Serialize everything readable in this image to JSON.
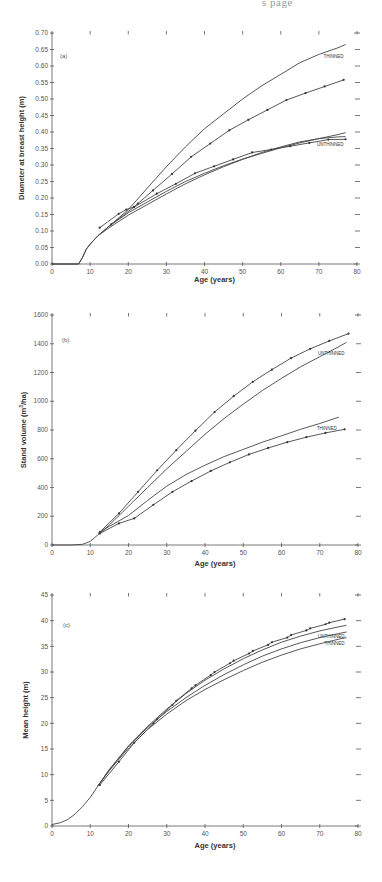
{
  "page_header": "s page",
  "chart_data": [
    {
      "type": "line",
      "panel": "(a)",
      "title": "",
      "xlabel": "Age (years)",
      "ylabel": "Diameter at breast height (m)",
      "xlim": [
        0,
        80
      ],
      "ylim": [
        0,
        0.7
      ],
      "xticks": [
        0,
        10,
        20,
        30,
        40,
        50,
        60,
        70,
        80
      ],
      "yticks": [
        0.0,
        0.05,
        0.1,
        0.15,
        0.2,
        0.25,
        0.3,
        0.35,
        0.4,
        0.45,
        0.5,
        0.55,
        0.6,
        0.65,
        0.7
      ],
      "ytick_labels": [
        "0.00",
        "0.05",
        "0.10",
        "0.15",
        "0.20",
        "0.25",
        "0.30",
        "0.35",
        "0.40",
        "0.45",
        "0.50",
        "0.55",
        "0.60",
        "0.65",
        "0.70"
      ],
      "grid": false,
      "series": [
        {
          "name": "THINNED (model)",
          "label": "THINNED",
          "markers": false,
          "x": [
            0,
            7,
            8,
            9,
            10,
            12,
            15,
            20,
            25,
            30,
            35,
            40,
            45,
            50,
            55,
            60,
            65,
            70,
            75,
            77
          ],
          "y": [
            0,
            0,
            0.02,
            0.045,
            0.06,
            0.085,
            0.115,
            0.165,
            0.23,
            0.295,
            0.355,
            0.41,
            0.455,
            0.5,
            0.54,
            0.575,
            0.61,
            0.635,
            0.655,
            0.665
          ]
        },
        {
          "name": "THINNED (observed)",
          "label": "",
          "markers": true,
          "x": [
            12.5,
            17.5,
            19.5,
            21.5,
            22.5,
            26.5,
            31.5,
            36.5,
            41.5,
            46.5,
            51.5,
            56.5,
            61.5,
            66.5,
            71.5,
            76.5
          ],
          "y": [
            0.11,
            0.152,
            0.165,
            0.173,
            0.183,
            0.223,
            0.273,
            0.325,
            0.365,
            0.405,
            0.437,
            0.467,
            0.497,
            0.518,
            0.538,
            0.558
          ]
        },
        {
          "name": "UNTHINNED (model)",
          "label": "UNTHINNED",
          "markers": false,
          "x": [
            0,
            7,
            8,
            9,
            10,
            12,
            15,
            20,
            25,
            30,
            35,
            40,
            45,
            50,
            55,
            60,
            65,
            70,
            75,
            77
          ],
          "y": [
            0,
            0,
            0.02,
            0.045,
            0.06,
            0.085,
            0.115,
            0.155,
            0.188,
            0.22,
            0.25,
            0.275,
            0.298,
            0.318,
            0.335,
            0.352,
            0.367,
            0.38,
            0.392,
            0.398
          ]
        },
        {
          "name": "UNTHINNED (observed)",
          "label": "",
          "markers": true,
          "x": [
            15.5,
            21.5,
            27.5,
            32.5,
            37.5,
            42.5,
            47.5,
            52.5,
            57.5,
            62.5,
            67.5,
            72.5,
            77
          ],
          "y": [
            0.12,
            0.172,
            0.213,
            0.243,
            0.275,
            0.296,
            0.317,
            0.338,
            0.347,
            0.357,
            0.367,
            0.377,
            0.378
          ]
        },
        {
          "name": "UNTHINNED (lower model)",
          "label": "",
          "markers": false,
          "x": [
            12,
            15,
            20,
            25,
            30,
            35,
            40,
            45,
            50,
            55,
            60,
            65,
            70,
            75,
            77
          ],
          "y": [
            0.085,
            0.11,
            0.148,
            0.18,
            0.212,
            0.243,
            0.27,
            0.295,
            0.317,
            0.338,
            0.355,
            0.37,
            0.38,
            0.385,
            0.386
          ]
        }
      ]
    },
    {
      "type": "line",
      "panel": "(b)",
      "title": "",
      "xlabel": "Age (years)",
      "ylabel": "Stand volume (m3/ha)",
      "ylabel_parts": [
        "Stand  volume  (m",
        "3",
        "/ha)"
      ],
      "xlim": [
        0,
        80
      ],
      "ylim": [
        0,
        1600
      ],
      "xticks": [
        0,
        10,
        20,
        30,
        40,
        50,
        60,
        70,
        80
      ],
      "yticks": [
        0,
        200,
        400,
        600,
        800,
        1000,
        1200,
        1400,
        1600
      ],
      "ytick_labels": [
        "0",
        "200",
        "400",
        "600",
        "800",
        "1000",
        "1200",
        "1400",
        "1600"
      ],
      "grid": false,
      "series": [
        {
          "name": "UNTHINNED (observed)",
          "label": "",
          "markers": true,
          "x": [
            12.5,
            17.5,
            22.5,
            27.5,
            32.5,
            37.5,
            42.5,
            47.5,
            52.5,
            57.5,
            62.5,
            67.5,
            72.5,
            77.5
          ],
          "y": [
            90,
            220,
            370,
            520,
            660,
            795,
            925,
            1035,
            1135,
            1220,
            1300,
            1365,
            1420,
            1470
          ]
        },
        {
          "name": "UNTHINNED (model)",
          "label": "UNTHINNED",
          "markers": false,
          "x": [
            0,
            5,
            8,
            10,
            12,
            15,
            20,
            25,
            30,
            35,
            40,
            45,
            50,
            55,
            60,
            65,
            70,
            75,
            77
          ],
          "y": [
            0,
            0,
            5,
            25,
            70,
            140,
            270,
            400,
            530,
            650,
            770,
            880,
            980,
            1075,
            1160,
            1240,
            1310,
            1380,
            1410
          ]
        },
        {
          "name": "THINNED (model)",
          "label": "THINNED",
          "markers": false,
          "x": [
            12,
            15,
            20,
            25,
            30,
            35,
            40,
            45,
            50,
            55,
            60,
            65,
            70,
            75
          ],
          "y": [
            80,
            130,
            205,
            310,
            410,
            490,
            555,
            615,
            665,
            715,
            760,
            805,
            845,
            890
          ]
        },
        {
          "name": "THINNED (observed)",
          "label": "",
          "markers": true,
          "x": [
            12.5,
            17.5,
            21.5,
            26.5,
            31.5,
            36.5,
            41.5,
            46.5,
            51.5,
            56.5,
            61.5,
            66.5,
            71.5,
            76.5
          ],
          "y": [
            80,
            150,
            185,
            280,
            370,
            445,
            515,
            575,
            630,
            675,
            715,
            750,
            780,
            805
          ]
        }
      ]
    },
    {
      "type": "line",
      "panel": "(c)",
      "title": "",
      "xlabel": "Age (years)",
      "ylabel": "Mean height (m)",
      "xlim": [
        0,
        80
      ],
      "ylim": [
        0,
        45
      ],
      "xticks": [
        0,
        10,
        20,
        30,
        40,
        50,
        60,
        70,
        80
      ],
      "yticks": [
        0,
        5,
        10,
        15,
        20,
        25,
        30,
        35,
        40,
        45
      ],
      "ytick_labels": [
        "0",
        "5",
        "10",
        "15",
        "20",
        "25",
        "30",
        "35",
        "40",
        "45"
      ],
      "grid": false,
      "series": [
        {
          "name": "UNTHINNED (observed)",
          "label": "",
          "markers": true,
          "x": [
            12.5,
            17.5,
            21.5,
            26.5,
            27.5,
            31.5,
            32.5,
            36.5,
            37.5,
            41.5,
            42.5,
            46.5,
            47.5,
            51.5,
            52.5,
            56.5,
            57.5,
            61.5,
            62.5,
            66.5,
            67.5,
            71.5,
            72.5,
            76.5
          ],
          "y": [
            8,
            12.5,
            16.2,
            20,
            20.8,
            23.6,
            24.4,
            26.8,
            27.4,
            29.4,
            30,
            31.7,
            32.2,
            33.6,
            34.1,
            35.3,
            35.8,
            36.7,
            37.2,
            38.1,
            38.5,
            39.3,
            39.6,
            40.3
          ]
        },
        {
          "name": "UNTHINNED (model)",
          "label": "UNTHINNED",
          "markers": false,
          "x": [
            0,
            2,
            4,
            6,
            8,
            10,
            12,
            15,
            20,
            25,
            30,
            35,
            40,
            45,
            50,
            55,
            60,
            65,
            70,
            75,
            77
          ],
          "y": [
            0.3,
            0.6,
            1.2,
            2.3,
            3.8,
            5.6,
            7.8,
            11,
            15.6,
            19.4,
            22.8,
            25.8,
            28.4,
            30.6,
            32.6,
            34.3,
            35.8,
            37,
            38,
            38.8,
            39.1
          ]
        },
        {
          "name": "THINNED (model)",
          "label": "THINNED",
          "markers": false,
          "x": [
            12,
            15,
            20,
            25,
            30,
            35,
            40,
            45,
            50,
            55,
            60,
            65,
            70,
            75,
            77
          ],
          "y": [
            7.8,
            11,
            15.5,
            19.2,
            22.3,
            25,
            27.4,
            29.5,
            31.4,
            33.1,
            34.5,
            35.7,
            36.7,
            37.5,
            37.8
          ]
        },
        {
          "name": "THINNED (lower model)",
          "label": "",
          "markers": false,
          "x": [
            12,
            15,
            20,
            25,
            30,
            35,
            40,
            45,
            50,
            55,
            60,
            65,
            70,
            75,
            77
          ],
          "y": [
            7.8,
            10.8,
            15.2,
            18.8,
            21.8,
            24.4,
            26.6,
            28.5,
            30.3,
            31.9,
            33.3,
            34.5,
            35.5,
            36.4,
            36.7
          ]
        }
      ]
    }
  ]
}
